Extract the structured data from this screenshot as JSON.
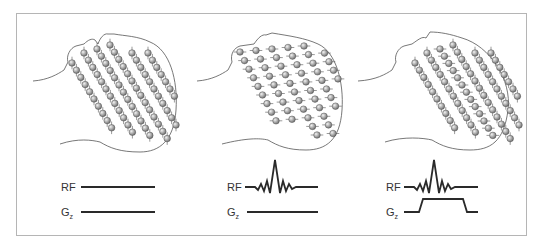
{
  "figure": {
    "colors": {
      "frame": "#b5b5b5",
      "outline": "#555555",
      "waveform": "#2a2a2a",
      "sphere_light": "#e6e6e6",
      "sphere_dark": "#7a7a7a",
      "label": "#333333"
    },
    "panels": [
      {
        "id": "panel-1",
        "state": "aligned",
        "rf_label": "RF",
        "gz_label": "G",
        "gz_subscript": "z",
        "rf_waveform": "flat",
        "gz_waveform": "flat"
      },
      {
        "id": "panel-2",
        "state": "all-excited",
        "rf_label": "RF",
        "gz_label": "G",
        "gz_subscript": "z",
        "rf_waveform": "sinc",
        "gz_waveform": "flat"
      },
      {
        "id": "panel-3",
        "state": "slice-excited",
        "rf_label": "RF",
        "gz_label": "G",
        "gz_subscript": "z",
        "rf_waveform": "sinc",
        "gz_waveform": "trapezoid"
      }
    ]
  }
}
